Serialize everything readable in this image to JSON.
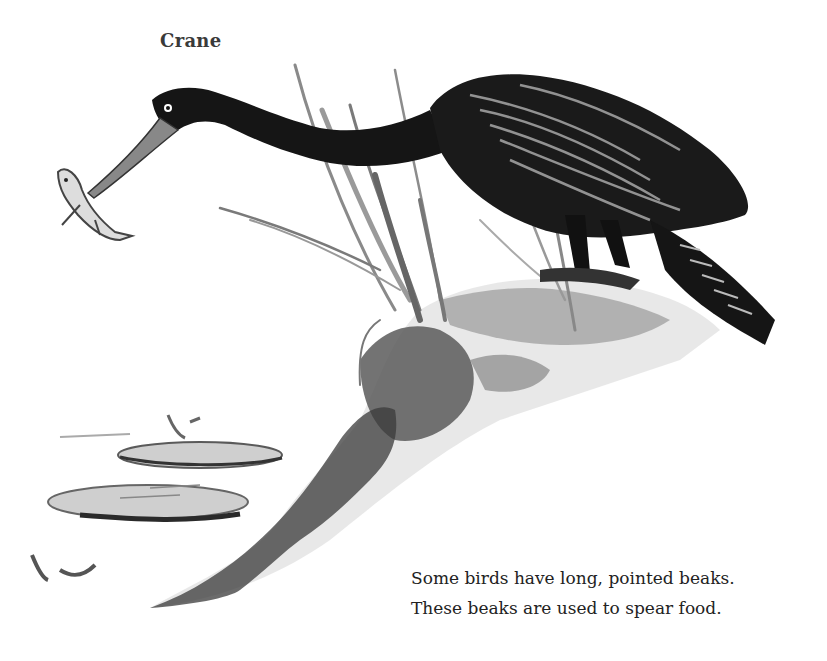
{
  "page": {
    "label": "Crane",
    "caption": {
      "lines": [
        "Some birds have long, pointed beaks.",
        "These beaks are used to spear food."
      ]
    },
    "illustration": {
      "subject": "crane-spearing-fish",
      "elements": [
        "crane",
        "fish",
        "reeds",
        "rock-bank",
        "lily-pads",
        "water-plants"
      ],
      "colors": {
        "ink_dark": "#141414",
        "ink_mid": "#555555",
        "ink_light": "#9a9a9a",
        "wash": "#c8c8c8",
        "paper": "#ffffff"
      }
    }
  }
}
